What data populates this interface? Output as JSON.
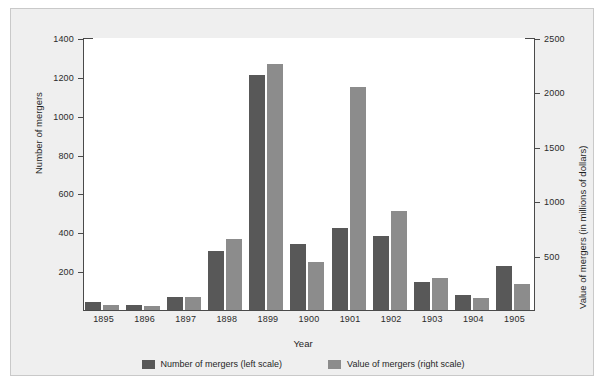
{
  "chart_data": {
    "type": "bar",
    "title": "",
    "xlabel": "Year",
    "ylabel": "Number of mergers",
    "ylabel_right": "Value of mergers (in millions of dollars)",
    "categories": [
      "1895",
      "1896",
      "1897",
      "1898",
      "1899",
      "1900",
      "1901",
      "1902",
      "1903",
      "1904",
      "1905"
    ],
    "series": [
      {
        "name": "Number of mergers (left scale)",
        "axis": "left",
        "color": "#585858",
        "values": [
          43,
          26,
          69,
          303,
          1208,
          340,
          423,
          379,
          142,
          79,
          226
        ]
      },
      {
        "name": "Value of mergers (right scale)",
        "axis": "right",
        "color": "#8c8c8c",
        "values": [
          50,
          38,
          120,
          650,
          2262,
          442,
          2053,
          911,
          297,
          110,
          243
        ]
      }
    ],
    "ylim": [
      0,
      1400
    ],
    "yticks": [
      "200",
      "400",
      "600",
      "800",
      "1000",
      "1200",
      "1400"
    ],
    "ylim_right": [
      0,
      2500
    ],
    "yticks_right": [
      "500",
      "1000",
      "1500",
      "2000",
      "2500"
    ],
    "grid": false,
    "legend_position": "bottom"
  },
  "legend": {
    "items": [
      {
        "label": "Number of mergers (left scale)",
        "color": "#585858"
      },
      {
        "label": "Value of mergers (right scale)",
        "color": "#8c8c8c"
      }
    ]
  }
}
